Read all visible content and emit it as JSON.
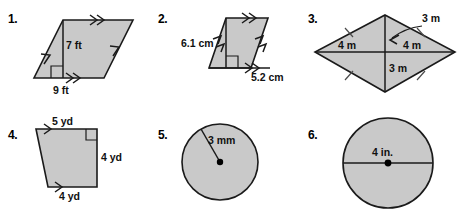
{
  "worksheet": {
    "background_color": "#ffffff",
    "shape_fill_color": "#c9c9c9",
    "shape_stroke_color": "#1a1a1a",
    "problems": [
      {
        "number": "1.",
        "shape": "parallelogram",
        "labels": [
          {
            "name": "height-label",
            "text": "7 ft"
          },
          {
            "name": "base-label",
            "text": "9 ft"
          }
        ],
        "marks": {
          "right_angle": true,
          "parallel_arrows": "double"
        }
      },
      {
        "number": "2.",
        "shape": "parallelogram",
        "labels": [
          {
            "name": "height-label",
            "text": "6.1 cm"
          },
          {
            "name": "base-label",
            "text": "5.2 cm"
          }
        ],
        "marks": {
          "right_angle": true,
          "parallel_arrows": "double"
        }
      },
      {
        "number": "3.",
        "shape": "rhombus",
        "labels": [
          {
            "name": "upper-diagonal-label",
            "text": "3 m"
          },
          {
            "name": "left-diagonal-label",
            "text": "4 m"
          },
          {
            "name": "right-diagonal-label",
            "text": "4 m"
          },
          {
            "name": "lower-diagonal-label",
            "text": "3 m"
          }
        ],
        "marks": {
          "side_ticks": true,
          "leader_arrow": true
        }
      },
      {
        "number": "4.",
        "shape": "trapezoid",
        "labels": [
          {
            "name": "top-base-label",
            "text": "5 yd"
          },
          {
            "name": "height-label",
            "text": "4 yd"
          },
          {
            "name": "bottom-base-label",
            "text": "4 yd"
          }
        ],
        "marks": {
          "right_angle": true,
          "parallel_arrows": "single"
        }
      },
      {
        "number": "5.",
        "shape": "circle",
        "labels": [
          {
            "name": "radius-label",
            "text": "3 mm"
          }
        ],
        "marks": {
          "center_dot": true,
          "radius_line": true
        }
      },
      {
        "number": "6.",
        "shape": "circle",
        "labels": [
          {
            "name": "diameter-label",
            "text": "4 in."
          }
        ],
        "marks": {
          "center_dot": true,
          "diameter_line": true
        }
      }
    ]
  }
}
